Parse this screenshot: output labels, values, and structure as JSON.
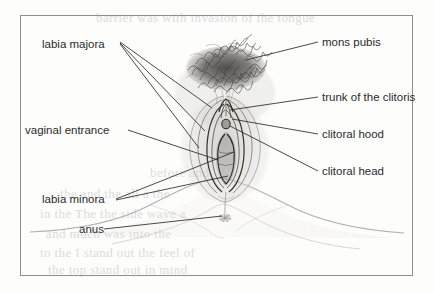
{
  "figure": {
    "type": "anatomical-illustration",
    "border_color": "#8e8e8e",
    "background_color": "#fdfdfc",
    "ink_color": "#2b2b2b"
  },
  "labels": [
    {
      "id": "labia-majora",
      "text": "labia majora",
      "side": "left",
      "x": 42,
      "y": 44
    },
    {
      "id": "vaginal-entrance",
      "text": "vaginal entrance",
      "side": "left",
      "x": 25,
      "y": 132
    },
    {
      "id": "labia-minora",
      "text": "labia minora",
      "side": "left",
      "x": 42,
      "y": 201
    },
    {
      "id": "anus",
      "text": "anus",
      "side": "left",
      "x": 79,
      "y": 231
    },
    {
      "id": "mons-pubis",
      "text": "mons pubis",
      "side": "right",
      "x": 322,
      "y": 44
    },
    {
      "id": "trunk-of-the-clitoris",
      "text": "trunk of the clitoris",
      "side": "right",
      "x": 322,
      "y": 99
    },
    {
      "id": "clitoral-hood",
      "text": "clitoral hood",
      "side": "right",
      "x": 322,
      "y": 136
    },
    {
      "id": "clitoral-head",
      "text": "clitoral head",
      "side": "right",
      "x": 322,
      "y": 173
    }
  ],
  "bleed_through_text": [
    {
      "text": "barrier was  with invasion  of the  tongue",
      "x": 96,
      "y": 10
    },
    {
      "text": "before and",
      "x": 150,
      "y": 165
    },
    {
      "text": "the  and the  all a the",
      "x": 60,
      "y": 186
    },
    {
      "text": "in the  The  the  side  wave  a",
      "x": 40,
      "y": 206
    },
    {
      "text": "and  much  was  into  the",
      "x": 46,
      "y": 226
    },
    {
      "text": "to  the  I  stand  out  the  feel  of",
      "x": 40,
      "y": 245
    },
    {
      "text": "the  top  stand  out  in  mind",
      "x": 48,
      "y": 262
    }
  ]
}
